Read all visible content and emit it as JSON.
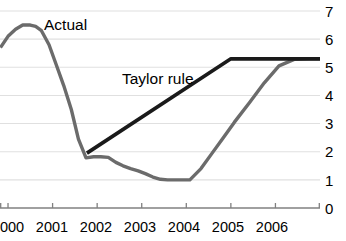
{
  "chart_data": {
    "type": "line",
    "title": "",
    "xlabel": "",
    "ylabel": "",
    "xlim": [
      1999.82,
      2007.0
    ],
    "ylim": [
      0,
      7
    ],
    "grid": true,
    "grid_axis": "y",
    "legend_position": "inline-annotation",
    "y_ticks": [
      7,
      6,
      5,
      4,
      3,
      2,
      1,
      0
    ],
    "y_tick_labels": [
      "7",
      "6",
      "5",
      "4",
      "3",
      "2",
      "1",
      "0"
    ],
    "y_axis_side": "right",
    "x_ticks": [
      2000,
      2001,
      2002,
      2003,
      2004,
      2005,
      2006
    ],
    "x_tick_labels": [
      "2000",
      "2001",
      "2002",
      "2003",
      "2004",
      "2005",
      "2006"
    ],
    "series": [
      {
        "name": "Actual",
        "color": "#6b6b6b",
        "linewidth": 3.4,
        "x": [
          1999.83,
          2000.0,
          2000.17,
          2000.33,
          2000.5,
          2000.62,
          2000.75,
          2000.92,
          2001.08,
          2001.25,
          2001.42,
          2001.58,
          2001.75,
          2001.92,
          2002.08,
          2002.25,
          2002.42,
          2002.58,
          2002.75,
          2002.92,
          2003.08,
          2003.25,
          2003.42,
          2003.58,
          2003.83,
          2004.08,
          2004.33,
          2004.58,
          2004.83,
          2005.08,
          2005.42,
          2005.75,
          2006.08,
          2006.42,
          2006.75,
          2007.0
        ],
        "y": [
          5.7,
          6.1,
          6.35,
          6.5,
          6.5,
          6.45,
          6.3,
          5.8,
          5.1,
          4.35,
          3.5,
          2.45,
          1.78,
          1.82,
          1.82,
          1.8,
          1.62,
          1.5,
          1.4,
          1.32,
          1.22,
          1.1,
          1.02,
          1.0,
          1.0,
          1.0,
          1.4,
          1.95,
          2.5,
          3.05,
          3.75,
          4.45,
          5.05,
          5.28,
          5.3,
          5.3
        ]
      },
      {
        "name": "Taylor rule",
        "color": "#1a1a1a",
        "linewidth": 3.6,
        "x": [
          2001.77,
          2005.0,
          2007.0
        ],
        "y": [
          1.95,
          5.3,
          5.3
        ]
      }
    ],
    "annotations": [
      {
        "text": "Actual",
        "x": 2000.55,
        "y": 6.55,
        "color": "#000000"
      },
      {
        "text": "Taylor rule",
        "x": 2002.4,
        "y": 4.75,
        "color": "#000000"
      }
    ]
  },
  "axes": {
    "y_labels": [
      "7",
      "6",
      "5",
      "4",
      "3",
      "2",
      "1",
      "0"
    ],
    "x_labels": [
      "2000",
      "2001",
      "2002",
      "2003",
      "2004",
      "2005",
      "2006"
    ]
  },
  "labels": {
    "actual": "Actual",
    "taylor_rule": "Taylor rule"
  },
  "colors": {
    "actual_line": "#6b6b6b",
    "taylor_line": "#1a1a1a",
    "gridline": "#e0e0e0",
    "axis": "#808080",
    "text": "#000000",
    "background": "#ffffff"
  }
}
